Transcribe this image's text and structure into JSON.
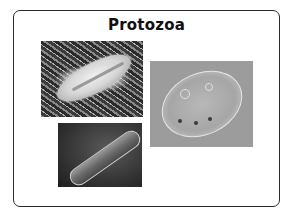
{
  "slide": {
    "title": "Protozoa",
    "images": [
      {
        "name": "paramecium-sem-image",
        "description": "scanning electron micrograph of a ciliated protozoan on fibers"
      },
      {
        "name": "paramecium-dark-sem-image",
        "description": "scanning electron micrograph of elongated protozoan on dark background"
      },
      {
        "name": "ciliate-light-micrograph-image",
        "description": "light micrograph of oval ciliate with cilia"
      }
    ]
  },
  "colors": {
    "background": "#ffffff",
    "border": "#2a2a2a",
    "title": "#111111"
  }
}
